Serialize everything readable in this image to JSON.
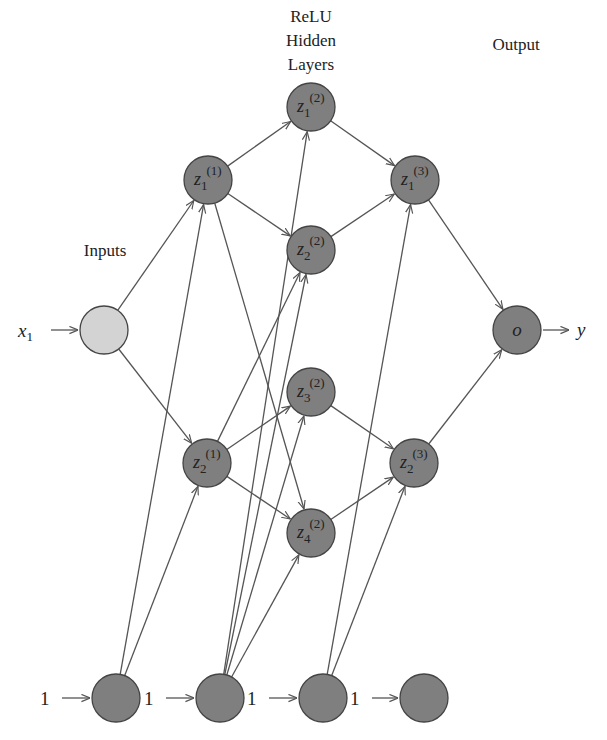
{
  "diagram": {
    "labels": {
      "hidden_title_line1": "ReLU",
      "hidden_title_line2": "Hidden",
      "hidden_title_line3": "Layers",
      "inputs": "Inputs",
      "output": "Output",
      "x_input": "x",
      "x_input_sub": "1",
      "y_output": "y"
    },
    "colors": {
      "input_node": "#d3d3d3",
      "node": "#7f7f7f",
      "stroke": "#444444",
      "edge": "#555555"
    },
    "nodes": [
      {
        "id": "x1",
        "label": "",
        "sub": "",
        "sup": "",
        "cx": 104,
        "cy": 330,
        "type": "input"
      },
      {
        "id": "z1_1",
        "label": "z",
        "sub": "1",
        "sup": "(1)",
        "cx": 208,
        "cy": 180,
        "type": "hidden"
      },
      {
        "id": "z2_1",
        "label": "z",
        "sub": "2",
        "sup": "(1)",
        "cx": 207,
        "cy": 463,
        "type": "hidden"
      },
      {
        "id": "z1_2",
        "label": "z",
        "sub": "1",
        "sup": "(2)",
        "cx": 311,
        "cy": 107,
        "type": "hidden"
      },
      {
        "id": "z2_2",
        "label": "z",
        "sub": "2",
        "sup": "(2)",
        "cx": 311,
        "cy": 250,
        "type": "hidden"
      },
      {
        "id": "z3_2",
        "label": "z",
        "sub": "3",
        "sup": "(2)",
        "cx": 311,
        "cy": 392,
        "type": "hidden"
      },
      {
        "id": "z4_2",
        "label": "z",
        "sub": "4",
        "sup": "(2)",
        "cx": 311,
        "cy": 533,
        "type": "hidden"
      },
      {
        "id": "z1_3",
        "label": "z",
        "sub": "1",
        "sup": "(3)",
        "cx": 415,
        "cy": 180,
        "type": "hidden"
      },
      {
        "id": "z2_3",
        "label": "z",
        "sub": "2",
        "sup": "(3)",
        "cx": 414,
        "cy": 463,
        "type": "hidden"
      },
      {
        "id": "o",
        "label": "o",
        "sub": "",
        "sup": "",
        "cx": 517,
        "cy": 330,
        "type": "output"
      },
      {
        "id": "b1",
        "label": "",
        "sub": "",
        "sup": "",
        "cx": 116,
        "cy": 698,
        "type": "bias"
      },
      {
        "id": "b2",
        "label": "",
        "sub": "",
        "sup": "",
        "cx": 220,
        "cy": 698,
        "type": "bias"
      },
      {
        "id": "b3",
        "label": "",
        "sub": "",
        "sup": "",
        "cx": 323,
        "cy": 698,
        "type": "bias"
      },
      {
        "id": "b4",
        "label": "",
        "sub": "",
        "sup": "",
        "cx": 424,
        "cy": 698,
        "type": "bias"
      }
    ],
    "edges": [
      [
        "x1",
        "z1_1"
      ],
      [
        "x1",
        "z2_1"
      ],
      [
        "z1_1",
        "z1_2"
      ],
      [
        "z1_1",
        "z2_2"
      ],
      [
        "z1_1",
        "z4_2"
      ],
      [
        "z2_1",
        "z2_2"
      ],
      [
        "z2_1",
        "z3_2"
      ],
      [
        "z2_1",
        "z4_2"
      ],
      [
        "z1_2",
        "z1_3"
      ],
      [
        "z2_2",
        "z1_3"
      ],
      [
        "z3_2",
        "z2_3"
      ],
      [
        "z4_2",
        "z2_3"
      ],
      [
        "z1_3",
        "o"
      ],
      [
        "z2_3",
        "o"
      ],
      [
        "b1",
        "z1_1"
      ],
      [
        "b1",
        "z2_1"
      ],
      [
        "b2",
        "z1_2"
      ],
      [
        "b2",
        "z2_2"
      ],
      [
        "b2",
        "z3_2"
      ],
      [
        "b2",
        "z4_2"
      ],
      [
        "b3",
        "z1_3"
      ],
      [
        "b3",
        "z2_3"
      ]
    ],
    "bias_labels": [
      "1",
      "1",
      "1",
      "1"
    ],
    "node_radius": 24
  }
}
